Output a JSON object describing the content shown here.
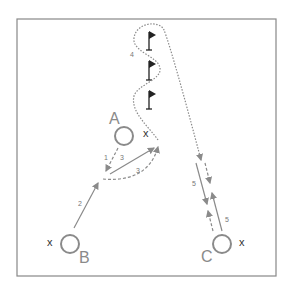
{
  "diagram": {
    "type": "sports drill",
    "field": {
      "border_color": "#888888",
      "background": "#ffffff"
    },
    "players": [
      {
        "id": "A",
        "label": "A",
        "marker": "x"
      },
      {
        "id": "B",
        "label": "B",
        "marker": "x"
      },
      {
        "id": "C",
        "label": "C",
        "marker": "x"
      }
    ],
    "flags": 3,
    "steps": [
      {
        "n": "1",
        "type": "pass (dashed)",
        "from": "A",
        "to": "front of B"
      },
      {
        "n": "2",
        "type": "run (solid)",
        "from": "B"
      },
      {
        "n": "3",
        "type": "pass (solid)"
      },
      {
        "n": "3",
        "type": "run (dashed)"
      },
      {
        "n": "4",
        "type": "dribble (wavy) around flags"
      },
      {
        "n": "5",
        "type": "pass/run (solid)"
      },
      {
        "n": "5",
        "type": "return (solid)"
      }
    ],
    "labels": {
      "A": "A",
      "B": "B",
      "C": "C",
      "xA": "x",
      "xB": "x",
      "xC": "x",
      "s1": "1",
      "s2": "2",
      "s3a": "3",
      "s3b": "3",
      "s4": "4",
      "s5a": "5",
      "s5b": "5"
    },
    "colors": {
      "line": "#8a8a8a",
      "flag": "#222222",
      "player": "#8a8a8a"
    }
  }
}
